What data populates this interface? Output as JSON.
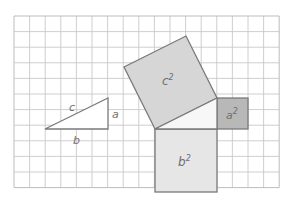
{
  "diagram": {
    "grid": {
      "x0": 14,
      "y0": 16,
      "cols": 17,
      "rows": 11,
      "cell": 15.6,
      "line_color": "#c8c8c8",
      "border_color": "#b5b5b5"
    },
    "labels": {
      "side_c": "c",
      "side_a": "a",
      "side_b": "b",
      "square_c": "c",
      "square_a": "a",
      "square_b": "b",
      "exponent": "2"
    },
    "colors": {
      "c_square": "#d6d6d6",
      "a_square": "#b8b8b8",
      "b_square": "#e6e6e6",
      "triangle_fill": "#f7f7f7",
      "stroke": "#7a7a7a"
    }
  }
}
